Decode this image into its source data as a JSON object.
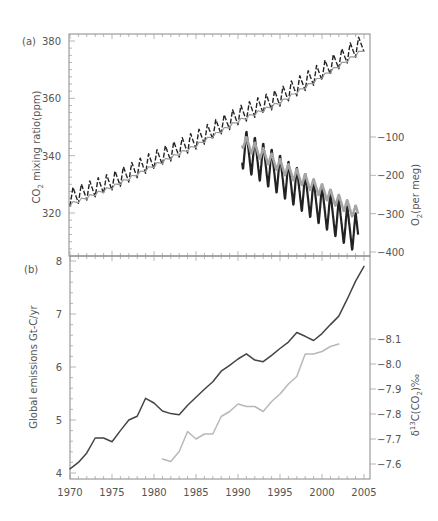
{
  "chart_data": [
    {
      "panel": "(a)",
      "type": "line",
      "xlabel": "",
      "x_range": [
        1970,
        2005
      ],
      "ylabel_left": "CO2 mixing ratio(ppm)",
      "ylabel_right": "O2(per meg)",
      "ylim_left": [
        305,
        382
      ],
      "ylim_right": [
        -405,
        -100
      ],
      "yticks_left": [
        320,
        340,
        360,
        380
      ],
      "yticks_right": [
        -100,
        -200,
        -300,
        -400
      ],
      "yticks_right_labels": [
        "−100",
        "−200",
        "−300",
        "−400"
      ],
      "grid": false,
      "series": [
        {
          "name": "CO2 (Northern Hemisphere, seasonal)",
          "axis": "left",
          "style": "dashed-black",
          "color": "#222222",
          "seasonal_amplitude": 3.2,
          "x": [
            1970,
            1975,
            1980,
            1985,
            1990,
            1995,
            2000,
            2005
          ],
          "values": [
            325.5,
            331,
            338.5,
            345.5,
            354,
            360.5,
            369.5,
            379.5
          ]
        },
        {
          "name": "CO2 (Southern Hemisphere)",
          "axis": "left",
          "style": "solid-grey",
          "color": "#9a9a9a",
          "seasonal_amplitude": 0.6,
          "x": [
            1970,
            1975,
            1980,
            1985,
            1990,
            1995,
            2000,
            2005
          ],
          "values": [
            323,
            329,
            336.5,
            343.5,
            352,
            358.5,
            367.5,
            377
          ]
        },
        {
          "name": "O2 (Northern Hemisphere, seasonal)",
          "axis": "right",
          "style": "solid-black",
          "color": "#222222",
          "seasonal_amplitude": 55,
          "x": [
            1990.5,
            1995,
            2000,
            2004.3
          ],
          "values": [
            -130,
            -200,
            -280,
            -355
          ]
        },
        {
          "name": "O2 (Southern Hemisphere)",
          "axis": "right",
          "style": "solid-grey",
          "color": "#a5a5a5",
          "seasonal_amplitude": 18,
          "x": [
            1990.5,
            1995,
            2000,
            2004.3
          ],
          "values": [
            -110,
            -175,
            -240,
            -300
          ]
        }
      ]
    },
    {
      "panel": "(b)",
      "type": "line",
      "xlabel": "",
      "x_range": [
        1970,
        2005
      ],
      "xticks": [
        1970,
        1975,
        1980,
        1985,
        1990,
        1995,
        2000,
        2005
      ],
      "ylabel_left": "Global emissions Gt-C/yr",
      "ylabel_right": "δ13C(CO2)‰",
      "ylim_left": [
        4,
        8
      ],
      "ylim_right": [
        -7.55,
        -8.2
      ],
      "yticks_left": [
        4,
        5,
        6,
        7,
        8
      ],
      "yticks_right": [
        -8.1,
        -8.0,
        -7.9,
        -7.8,
        -7.7,
        -7.6
      ],
      "yticks_right_labels": [
        "−8.1",
        "−8.0",
        "−7.9",
        "−7.8",
        "−7.7",
        "−7.6"
      ],
      "grid": false,
      "series": [
        {
          "name": "Global emissions",
          "axis": "left",
          "color": "#444444",
          "x": [
            1970,
            1971,
            1972,
            1973,
            1974,
            1975,
            1976,
            1977,
            1978,
            1979,
            1980,
            1981,
            1982,
            1983,
            1984,
            1985,
            1986,
            1987,
            1988,
            1989,
            1990,
            1991,
            1992,
            1993,
            1994,
            1995,
            1996,
            1997,
            1998,
            1999,
            2000,
            2001,
            2002,
            2003,
            2004,
            2005
          ],
          "values": [
            4.08,
            4.2,
            4.38,
            4.66,
            4.66,
            4.59,
            4.8,
            5.0,
            5.07,
            5.41,
            5.32,
            5.17,
            5.12,
            5.1,
            5.28,
            5.43,
            5.58,
            5.72,
            5.92,
            6.03,
            6.15,
            6.25,
            6.13,
            6.1,
            6.22,
            6.35,
            6.47,
            6.65,
            6.58,
            6.5,
            6.63,
            6.8,
            6.96,
            7.28,
            7.62,
            7.9
          ]
        },
        {
          "name": "δ13C(CO2)",
          "axis": "right",
          "color": "#b8b8b8",
          "x": [
            1981,
            1982,
            1983,
            1984,
            1985,
            1986,
            1987,
            1988,
            1989,
            1990,
            1991,
            1992,
            1993,
            1994,
            1995,
            1996,
            1997,
            1998,
            1999,
            2000,
            2001,
            2002
          ],
          "values": [
            -7.62,
            -7.61,
            -7.65,
            -7.73,
            -7.7,
            -7.72,
            -7.72,
            -7.79,
            -7.81,
            -7.84,
            -7.83,
            -7.83,
            -7.81,
            -7.85,
            -7.88,
            -7.92,
            -7.95,
            -8.04,
            -8.04,
            -8.05,
            -8.07,
            -8.08
          ]
        }
      ]
    }
  ],
  "panels": {
    "a": {
      "label": "(a)",
      "ylabel_left_main": "CO",
      "ylabel_left_sub": "2",
      "ylabel_left_rest": " mixing ratio(ppm)",
      "ylabel_right_main": "O",
      "ylabel_right_sub": "2",
      "ylabel_right_rest": "(per meg)"
    },
    "b": {
      "label": "(b)",
      "ylabel_left": "Global emissions Gt-C/yr",
      "ylabel_right_delta": "δ",
      "ylabel_right_sup": "13",
      "ylabel_right_c": "C(CO",
      "ylabel_right_sub": "2",
      "ylabel_right_end": ")‰"
    }
  }
}
